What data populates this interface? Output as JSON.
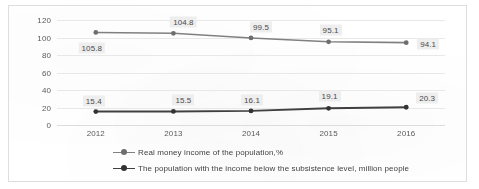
{
  "chart_data": {
    "type": "line",
    "title": "",
    "xlabel": "",
    "ylabel": "",
    "categories": [
      "2012",
      "2013",
      "2014",
      "2015",
      "2016"
    ],
    "ylim": [
      0,
      120
    ],
    "yticks": [
      0,
      20,
      40,
      60,
      80,
      100,
      120
    ],
    "ytick_labels": [
      "0",
      "20",
      "40",
      "60",
      "80",
      "100",
      "120"
    ],
    "grid": true,
    "legend_position": "bottom-left",
    "series": [
      {
        "name": "Real money income of the population,%",
        "color": "#808080",
        "values": [
          105.8,
          104.8,
          99.5,
          95.1,
          94.1
        ],
        "labels": [
          "105.8",
          "104.8",
          "99.5",
          "95.1",
          "94.1"
        ]
      },
      {
        "name": "The population with the income below the subsistence level, million people",
        "color": "#404040",
        "values": [
          15.4,
          15.5,
          16.1,
          19.1,
          20.3
        ],
        "labels": [
          "15.4",
          "15.5",
          "16.1",
          "19.1",
          "20.3"
        ]
      }
    ]
  },
  "legend": {
    "items": [
      {
        "label": "Real money income of the population,%",
        "marker": "line-marker-icon"
      },
      {
        "label": "The population with the income below the subsistence level, million people",
        "marker": "line-marker-icon"
      }
    ]
  },
  "colors": {
    "series_1": "#808080",
    "series_2": "#404040",
    "gridline": "#e8e8e8",
    "frame": "#dedede",
    "label_background": "#eeeeee",
    "text": "#3f3f3f"
  }
}
